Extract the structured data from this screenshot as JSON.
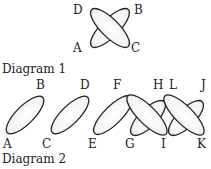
{
  "diagram1": {
    "caption": "Diagram 1",
    "labels": {
      "A": "A",
      "B": "B",
      "C": "C",
      "D": "D"
    }
  },
  "diagram2": {
    "caption": "Diagram 2",
    "labels": {
      "A": "A",
      "B": "B",
      "C": "C",
      "D": "D",
      "E": "E",
      "F": "F",
      "G": "G",
      "H": "H",
      "I": "I",
      "J": "J",
      "K": "K",
      "L": "L"
    }
  },
  "colors": {
    "stroke": "#222222",
    "background": "#ffffff"
  }
}
